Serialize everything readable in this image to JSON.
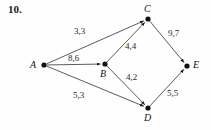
{
  "figure": {
    "problem_number": "10.",
    "nodes": [
      {
        "id": "A",
        "label": "A",
        "x": 44,
        "y": 65,
        "label_x": 30,
        "label_y": 59
      },
      {
        "id": "B",
        "label": "B",
        "x": 105,
        "y": 64,
        "label_x": 100,
        "label_y": 68
      },
      {
        "id": "C",
        "label": "C",
        "x": 148,
        "y": 19,
        "label_x": 144,
        "label_y": 3
      },
      {
        "id": "D",
        "label": "D",
        "x": 148,
        "y": 108,
        "label_x": 144,
        "label_y": 112
      },
      {
        "id": "E",
        "label": "E",
        "x": 187,
        "y": 66,
        "label_x": 193,
        "label_y": 59
      }
    ],
    "edges": [
      {
        "from": "A",
        "to": "C",
        "label": "3,3",
        "label_x": 74,
        "label_y": 26
      },
      {
        "from": "A",
        "to": "B",
        "label": "8,6",
        "label_x": 68,
        "label_y": 53
      },
      {
        "from": "A",
        "to": "D",
        "label": "5,3",
        "label_x": 73,
        "label_y": 90
      },
      {
        "from": "B",
        "to": "C",
        "label": "4,4",
        "label_x": 125,
        "label_y": 41
      },
      {
        "from": "B",
        "to": "D",
        "label": "4,2",
        "label_x": 126,
        "label_y": 72
      },
      {
        "from": "C",
        "to": "E",
        "label": "9,7",
        "label_x": 168,
        "label_y": 28
      },
      {
        "from": "D",
        "to": "E",
        "label": "5,5",
        "label_x": 167,
        "label_y": 88
      }
    ],
    "colors": {
      "edge": "#4a4a4a",
      "node": "#111111",
      "text": "#141414",
      "background": "#fefefe"
    }
  }
}
